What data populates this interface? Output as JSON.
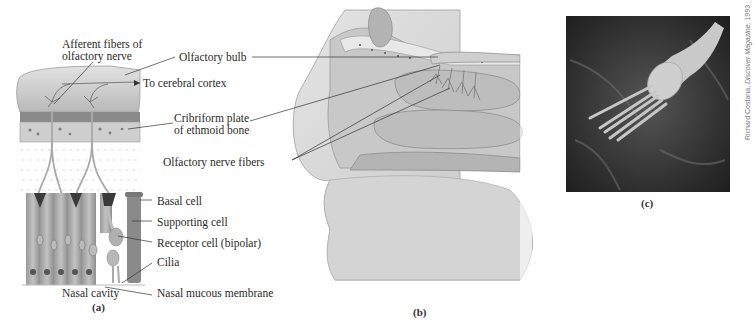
{
  "figure": {
    "panels": [
      {
        "id": "a",
        "label": "(a)",
        "labels": {
          "afferent_fibers_line1": "Afferent fibers of",
          "afferent_fibers_line2": "olfactory nerve",
          "olfactory_bulb": "Olfactory bulb",
          "to_cerebral_cortex": "To cerebral cortex",
          "cribriform_line1": "Cribriform plate",
          "cribriform_line2": "of ethmoid bone",
          "olfactory_nerve_fibers": "Olfactory nerve fibers",
          "basal_cell": "Basal cell",
          "supporting_cell": "Supporting cell",
          "receptor_cell": "Receptor cell (bipolar)",
          "cilia": "Cilia",
          "nasal_mucous_membrane": "Nasal mucous membrane",
          "nasal_cavity": "Nasal cavity"
        }
      },
      {
        "id": "b",
        "label": "(b)"
      },
      {
        "id": "c",
        "label": "(c)",
        "credit_author": "Richard Costana,",
        "credit_source": "Discover Magazine,",
        "credit_year": "1993"
      }
    ],
    "colors": {
      "tissue_light": "#d4d4d4",
      "tissue_mid": "#b8b8b8",
      "tissue_dark": "#8a8a8a",
      "micrograph_bg": "#2e2e2e",
      "leader_line": "#333333"
    }
  }
}
